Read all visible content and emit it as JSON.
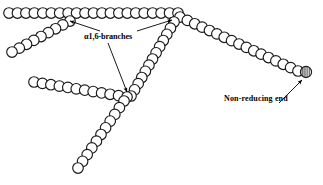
{
  "figure": {
    "type": "molecular-structure-diagram",
    "width": 323,
    "height": 185,
    "background_color": "#ffffff",
    "stroke_color": "#1a1a1a",
    "text_color": "#000000"
  },
  "labels": {
    "branches": "α1,6-branches",
    "non_reducing_end": "Non-reducing  end"
  },
  "label_positions": {
    "branches": {
      "x": 84,
      "y": 33
    },
    "non_reducing_end": {
      "x": 224,
      "y": 95
    }
  },
  "glyphs": {
    "residue": "open-circle",
    "terminal_residue": "hatched-circle"
  },
  "chains": [
    {
      "name": "main-horizontal-backbone",
      "residue_count": 21,
      "start": {
        "x": 9,
        "y": 13
      },
      "end": {
        "x": 178,
        "y": 13
      },
      "spacing": 8.45,
      "radius": 5.3
    },
    {
      "name": "upper-left-branch",
      "residue_count": 9,
      "start": {
        "x": 70,
        "y": 21
      },
      "end": {
        "x": 12,
        "y": 52
      },
      "spacing": 8.2,
      "radius": 5.3
    },
    {
      "name": "right-descending-chain",
      "residue_count": 17,
      "start": {
        "x": 180,
        "y": 17
      },
      "end": {
        "x": 298,
        "y": 71
      },
      "spacing": 8.1,
      "radius": 5.3
    },
    {
      "name": "central-descending-chain",
      "residue_count": 13,
      "start": {
        "x": 174,
        "y": 22
      },
      "end": {
        "x": 131,
        "y": 96
      },
      "spacing": 8.2,
      "radius": 5.3
    },
    {
      "name": "mid-left-horizontal-chain",
      "residue_count": 12,
      "start": {
        "x": 34,
        "y": 82
      },
      "end": {
        "x": 127,
        "y": 97
      },
      "spacing": 8.2,
      "radius": 5.3
    },
    {
      "name": "lower-descending-chain",
      "residue_count": 11,
      "start": {
        "x": 124,
        "y": 101
      },
      "end": {
        "x": 78,
        "y": 168
      },
      "spacing": 8.2,
      "radius": 5.3
    }
  ],
  "terminal_residue": {
    "x": 306,
    "y": 72,
    "radius": 5.6,
    "hatch": "vertical-lines"
  },
  "annotations": [
    {
      "name": "arrow-to-upper-left-branch-point",
      "from": {
        "x": 100,
        "y": 31
      },
      "to": {
        "x": 70,
        "y": 21
      }
    },
    {
      "name": "arrow-to-upper-right-branch-point",
      "from": {
        "x": 137,
        "y": 31
      },
      "to": {
        "x": 172,
        "y": 20
      }
    },
    {
      "name": "arrow-to-lower-branch-point",
      "from": {
        "x": 108,
        "y": 43
      },
      "to": {
        "x": 127,
        "y": 92
      }
    },
    {
      "name": "arrow-to-non-reducing-end",
      "from": {
        "x": 279,
        "y": 103
      },
      "to": {
        "x": 302,
        "y": 80
      }
    }
  ],
  "branch_points": [
    {
      "name": "alpha-1-6-branch-upper-left",
      "x": 70,
      "y": 18
    },
    {
      "name": "alpha-1-6-branch-upper-right",
      "x": 174,
      "y": 17
    },
    {
      "name": "alpha-1-6-branch-lower-center",
      "x": 127,
      "y": 96
    }
  ]
}
